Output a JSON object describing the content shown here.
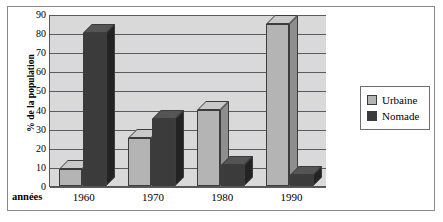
{
  "chart_data": {
    "type": "bar",
    "title": "",
    "subtitle": "",
    "xlabel": "années",
    "ylabel": "% de la population",
    "categories": [
      "1960",
      "1970",
      "1980",
      "1990"
    ],
    "series": [
      {
        "name": "Urbaine",
        "values": [
          9,
          25,
          40,
          85
        ],
        "color": "#b4b4b4"
      },
      {
        "name": "Nomade",
        "values": [
          80,
          35,
          11,
          6
        ],
        "color": "#3b3b3b"
      }
    ],
    "ylim": [
      0,
      90
    ],
    "ytick_step": 10,
    "yticks": [
      "90",
      "80",
      "70",
      "60",
      "50",
      "40",
      "30",
      "20",
      "10",
      "0"
    ],
    "grid": true,
    "grid_axis": "y",
    "legend_position": "right",
    "style": "3d-grouped-bars",
    "plot_background": "#d9d9d9"
  },
  "legend": {
    "items": [
      {
        "label": "Urbaine"
      },
      {
        "label": "Nomade"
      }
    ]
  }
}
